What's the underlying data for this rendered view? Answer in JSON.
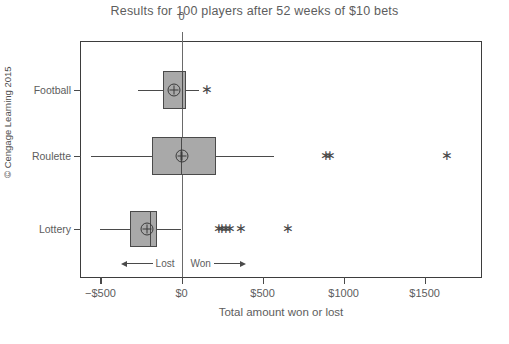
{
  "chart_data": {
    "type": "box",
    "title": "Results for 100 players after 52 weeks of $10 bets",
    "xlabel": "Total amount won or lost",
    "ylabel": "",
    "xlim": [
      -620,
      1860
    ],
    "xticks": [
      -500,
      0,
      500,
      1000,
      1500
    ],
    "xticklabels": [
      "−$500",
      "$0",
      "$500",
      "$1000",
      "$1500"
    ],
    "grid": false,
    "legend": null,
    "orientation": "horizontal",
    "categories": [
      "Football",
      "Roulette",
      "Lottery"
    ],
    "reference_line": {
      "value": 0,
      "label": "0"
    },
    "annotations": [
      {
        "text": "Lost",
        "direction": "left"
      },
      {
        "text": "Won",
        "direction": "right"
      }
    ],
    "boxes": [
      {
        "category": "Football",
        "whisker_low": -270,
        "q1": -115,
        "median": 0,
        "q3": 25,
        "whisker_high": 105,
        "mean": -45,
        "outliers": [
          155
        ]
      },
      {
        "category": "Roulette",
        "whisker_low": -560,
        "q1": -180,
        "median": -5,
        "q3": 215,
        "whisker_high": 570,
        "mean": 0,
        "outliers": [
          890,
          915,
          1640
        ]
      },
      {
        "category": "Lottery",
        "whisker_low": -500,
        "q1": -315,
        "median": -195,
        "q3": -150,
        "whisker_high": 0,
        "mean": -215,
        "outliers": [
          230,
          250,
          275,
          300,
          365,
          660
        ]
      }
    ]
  },
  "credit": "© Cengage Learning 2015",
  "colors": {
    "box_fill": "#a9a9a9",
    "line": "#4a4a4a",
    "frame": "#3d3d3d",
    "text": "#5d5d5d"
  }
}
